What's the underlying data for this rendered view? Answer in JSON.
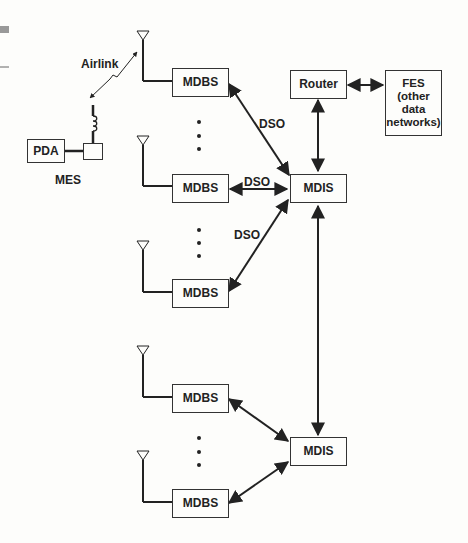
{
  "diagram": {
    "nodes": {
      "pda": "PDA",
      "mes": "MES",
      "airlink": "Airlink",
      "mdbs": [
        "MDBS",
        "MDBS",
        "MDBS",
        "MDBS",
        "MDBS"
      ],
      "mdis": [
        "MDIS",
        "MDIS"
      ],
      "router": "Router",
      "fes": "FES (other data networks)"
    },
    "edge_labels": [
      "DSO",
      "DSO",
      "DSO"
    ],
    "edges": [
      {
        "from": "MDBS-1",
        "to": "MDIS-1",
        "label": "DSO"
      },
      {
        "from": "MDBS-2",
        "to": "MDIS-1",
        "label": "DSO"
      },
      {
        "from": "MDBS-3",
        "to": "MDIS-1",
        "label": "DSO"
      },
      {
        "from": "MDBS-4",
        "to": "MDIS-2"
      },
      {
        "from": "MDBS-5",
        "to": "MDIS-2"
      },
      {
        "from": "Router",
        "to": "MDIS-1"
      },
      {
        "from": "Router",
        "to": "FES"
      },
      {
        "from": "MDIS-1",
        "to": "MDIS-2"
      },
      {
        "from": "MES",
        "to": "MDBS-1",
        "label": "Airlink"
      }
    ]
  }
}
